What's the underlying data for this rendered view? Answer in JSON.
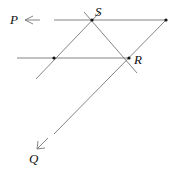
{
  "diagram": {
    "labels": {
      "P": "P",
      "S": "S",
      "R": "R",
      "Q": "Q"
    },
    "points": {
      "S": [
        92,
        20
      ],
      "R": [
        129,
        58
      ],
      "top_right": [
        166,
        20
      ],
      "mid_left": [
        54,
        58
      ]
    },
    "colors": {
      "line": "#777777",
      "point": "#111111",
      "label": "#111111"
    }
  }
}
